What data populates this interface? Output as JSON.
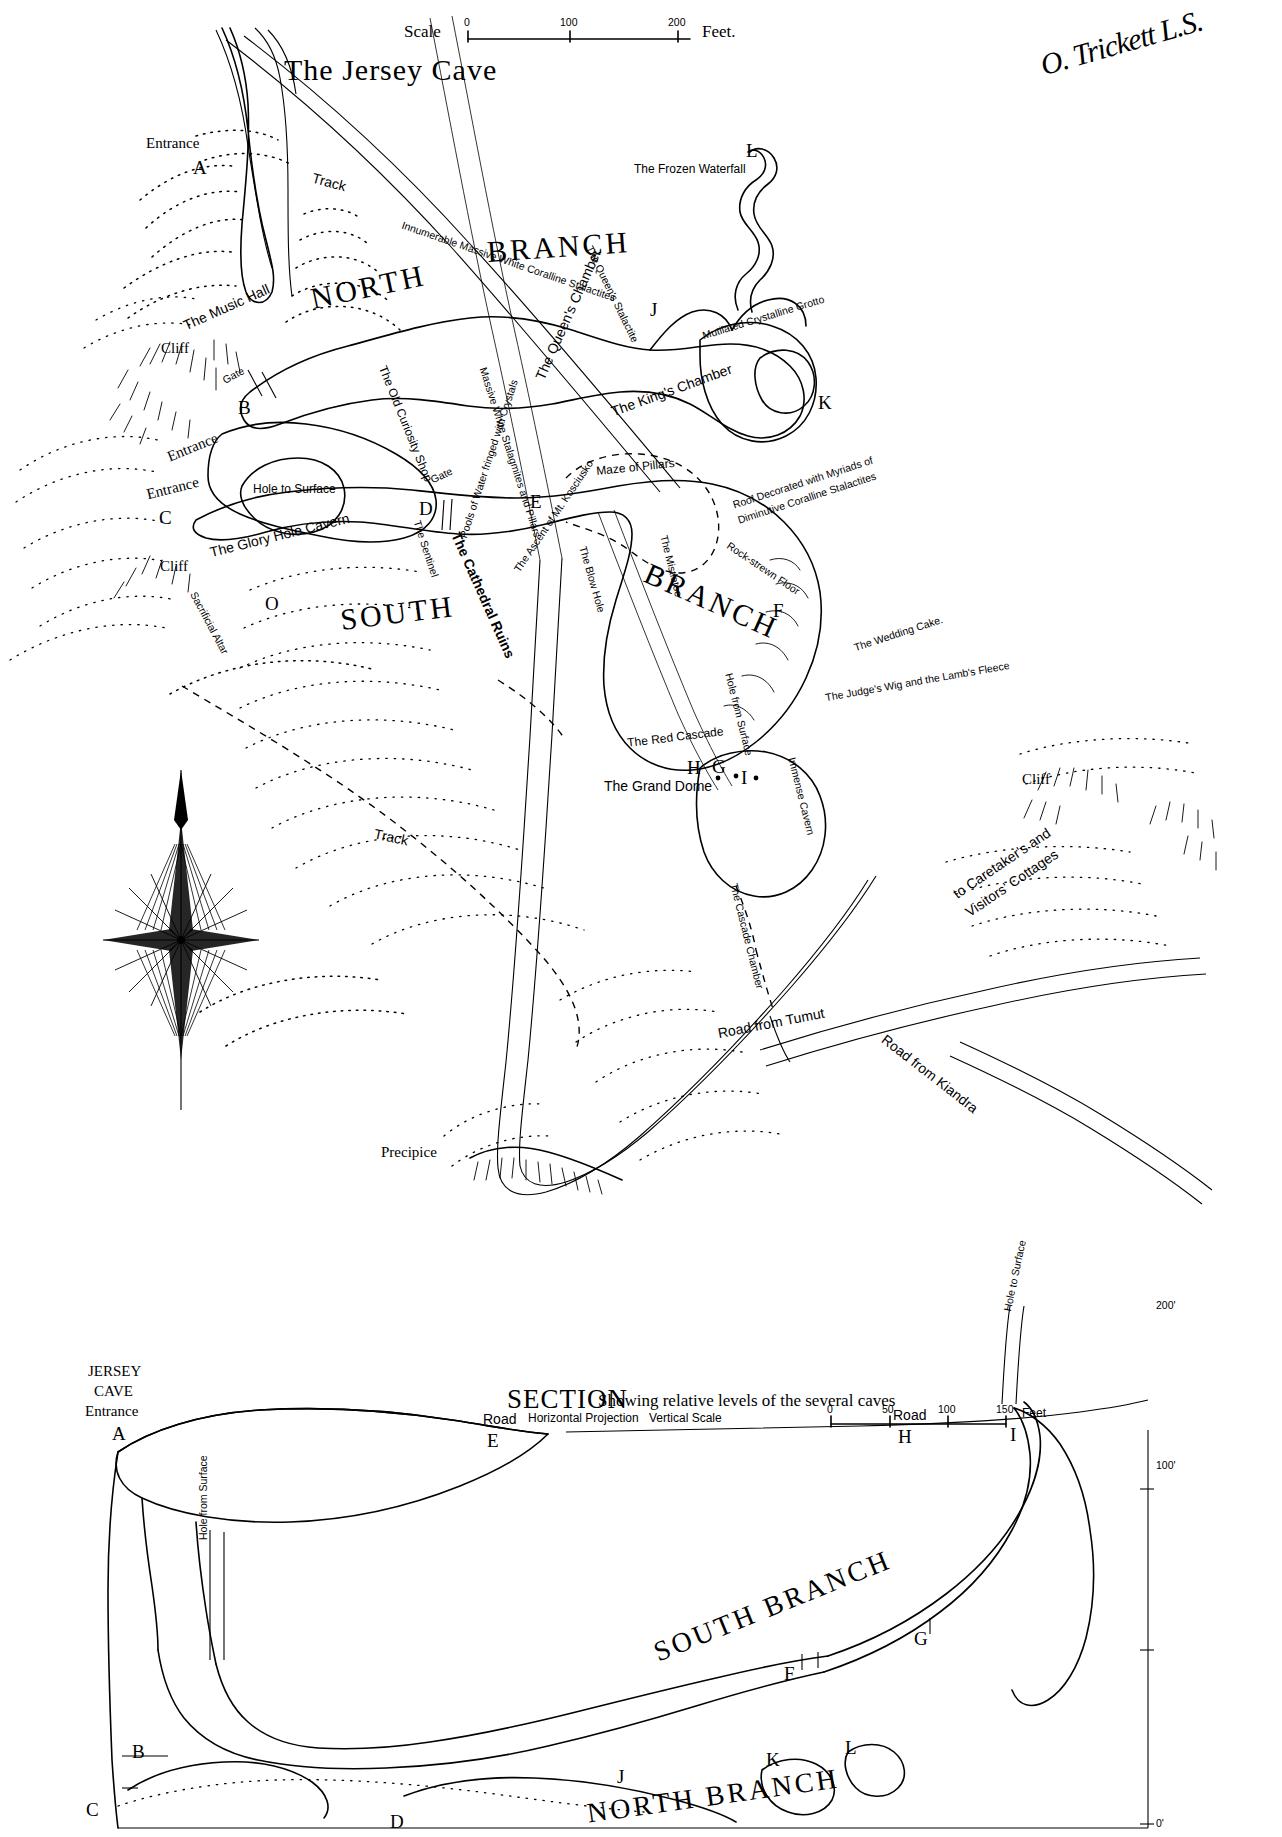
{
  "document": {
    "title": "The Jersey Cave",
    "surveyor_signature": "O. Trickett L.S."
  },
  "scale_bar": {
    "label": "Scale",
    "ticks": [
      "0",
      "100",
      "200"
    ],
    "unit": "Feet."
  },
  "plan": {
    "branches": [
      {
        "name": "NORTH"
      },
      {
        "name": "BRANCH"
      },
      {
        "name": "SOUTH"
      },
      {
        "name": "BRANCH"
      }
    ],
    "entrances": [
      {
        "label": "Entrance",
        "point": "A"
      },
      {
        "label": "Entrance",
        "point": "B"
      },
      {
        "label": "Entrance",
        "point": "C"
      }
    ],
    "survey_points": [
      "A",
      "B",
      "C",
      "D",
      "E",
      "F",
      "G",
      "H",
      "I",
      "J",
      "K",
      "L",
      "O"
    ],
    "features": [
      "The Music Hall",
      "The Old Curiosity Shop",
      "The Glory Hole Cavern",
      "Hole to Surface",
      "Sacrificial Altar",
      "The Sentinel",
      "Pools of Water fringed with Crystals",
      "The Cathedral Ruins",
      "The Ascent of Mt. Kosciusko",
      "The Blow Hole",
      "Maze of Pillars",
      "The Queen's Chamber",
      "The King's Chamber",
      "The Queen's Stalactite",
      "The Frozen Waterfall",
      "Mutilated Crystalline Grotto",
      "Innumerable Massive White Coralline Stalactites",
      "Massive White Stalagmites and Pillars",
      "Roof Decorated with Myriads of Diminutive Coralline Stalactites",
      "Rock-strewn Floor",
      "The Mistletoe",
      "The Wedding Cake.",
      "The Judge's Wig and the Lamb's Fleece",
      "The Red Cascade",
      "The Grand Dome",
      "Immense Cavern",
      "Hole from Surface",
      "The Cascade Chamber",
      "Precipice"
    ],
    "terrain_labels": [
      "Cliff",
      "Cliff",
      "Track",
      "Track",
      "Gate",
      "Gate"
    ],
    "roads": [
      "Road from Tumut",
      "Road from Kiandra",
      "to Caretaker's and Visitors' Cottages"
    ],
    "cliff_right": "Cliff",
    "compass": {
      "name": "compass-rose"
    }
  },
  "section": {
    "heading": "SECTION",
    "subheading": "Showing relative levels of the several caves",
    "projection_note": "Horizontal Projection",
    "vertical_scale_label": "Vertical Scale",
    "vertical_scale_ticks": [
      "0",
      "50",
      "100",
      "150"
    ],
    "vertical_scale_unit": "Feet",
    "left_title": [
      "JERSEY",
      "CAVE",
      "Entrance"
    ],
    "left_point": "A",
    "branch_labels": [
      "SOUTH BRANCH",
      "NORTH BRANCH"
    ],
    "road_labels": [
      "Road",
      "Road"
    ],
    "points": [
      "A",
      "E",
      "H",
      "I",
      "B",
      "C",
      "D",
      "J",
      "K",
      "L",
      "F",
      "G"
    ],
    "hole_labels": [
      "Hole from Surface",
      "Hole to Surface"
    ],
    "elevations": [
      "200'",
      "100'",
      "0'"
    ]
  },
  "colors": {
    "ink": "#000000",
    "paper": "#ffffff"
  }
}
